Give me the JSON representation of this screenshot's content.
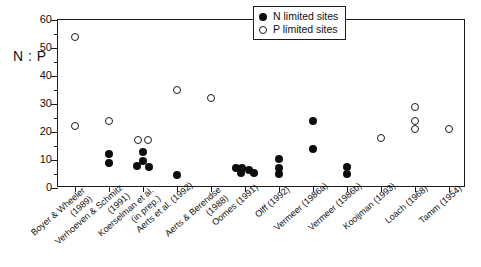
{
  "chart_data": {
    "type": "scatter",
    "title": "",
    "xlabel": "",
    "ylabel": "N : P",
    "ylim": [
      0,
      60
    ],
    "ytick_step": 10,
    "yminor_step": 5,
    "grid": false,
    "legend_position": "top-right",
    "ytick_labels": [
      "0",
      "10",
      "20",
      "30",
      "40",
      "50",
      "60"
    ],
    "categories": [
      "Boyer & Wheeler (1989)",
      "Verhoeven & Schmitz (1991)",
      "Koerselman et al. (in prep.)",
      "Aerts et al. (1992)",
      "Aerts & Berendse (1988)",
      "Oomes (1991)",
      "Olff (1992)",
      "Vermeer (1986a)",
      "Vermeer (1986b)",
      "Kooijman (1993)",
      "Loach (1968)",
      "Tamm (1954)"
    ],
    "category_lines": [
      [
        "Boyer & Wheeler",
        "(1989)"
      ],
      [
        "Verhoeven & Schmitz",
        "(1991)"
      ],
      [
        "Koerselman et al.",
        "(in prep.)"
      ],
      [
        "Aerts et al. (1992)"
      ],
      [
        "Aerts & Berendse",
        "(1988)"
      ],
      [
        "Oomes (1991)"
      ],
      [
        "Olff (1992)"
      ],
      [
        "Vermeer (1986a)"
      ],
      [
        "Vermeer (1986b)"
      ],
      [
        "Kooijman (1993)"
      ],
      [
        "Loach (1968)"
      ],
      [
        "Tamm (1954)"
      ]
    ],
    "series": [
      {
        "name": "N limited sites",
        "marker": "filled-circle",
        "color": "#0d0d0d",
        "points": [
          {
            "category": "Verhoeven & Schmitz (1991)",
            "x": 1,
            "y": 12
          },
          {
            "category": "Verhoeven & Schmitz (1991)",
            "x": 1,
            "y": 9
          },
          {
            "category": "Koerselman et al. (in prep.)",
            "x": 2,
            "y": 13
          },
          {
            "category": "Koerselman et al. (in prep.)",
            "x": 2,
            "y": 9.5
          },
          {
            "category": "Koerselman et al. (in prep.)",
            "x": 2,
            "y": 8
          },
          {
            "category": "Koerselman et al. (in prep.)",
            "x": 2,
            "y": 7.5
          },
          {
            "category": "Aerts et al. (1992)",
            "x": 3,
            "y": 4.5
          },
          {
            "category": "Oomes (1991)",
            "x": 5,
            "y": 7
          },
          {
            "category": "Oomes (1991)",
            "x": 5,
            "y": 7
          },
          {
            "category": "Oomes (1991)",
            "x": 5,
            "y": 6.5
          },
          {
            "category": "Oomes (1991)",
            "x": 5,
            "y": 5.5
          },
          {
            "category": "Oomes (1991)",
            "x": 5,
            "y": 5.5
          },
          {
            "category": "Olff (1992)",
            "x": 6,
            "y": 10.5
          },
          {
            "category": "Olff (1992)",
            "x": 6,
            "y": 7
          },
          {
            "category": "Olff (1992)",
            "x": 6,
            "y": 5
          },
          {
            "category": "Vermeer (1986a)",
            "x": 7,
            "y": 24
          },
          {
            "category": "Vermeer (1986a)",
            "x": 7,
            "y": 14
          },
          {
            "category": "Vermeer (1986b)",
            "x": 8,
            "y": 7.5
          },
          {
            "category": "Vermeer (1986b)",
            "x": 8,
            "y": 5
          }
        ]
      },
      {
        "name": "P limited sites",
        "marker": "open-circle",
        "color": "#ffffff",
        "points": [
          {
            "category": "Boyer & Wheeler (1989)",
            "x": 0,
            "y": 54
          },
          {
            "category": "Boyer & Wheeler (1989)",
            "x": 0,
            "y": 22
          },
          {
            "category": "Verhoeven & Schmitz (1991)",
            "x": 1,
            "y": 24
          },
          {
            "category": "Koerselman et al. (in prep.)",
            "x": 2,
            "y": 17
          },
          {
            "category": "Koerselman et al. (in prep.)",
            "x": 2,
            "y": 17
          },
          {
            "category": "Aerts et al. (1992)",
            "x": 3,
            "y": 35
          },
          {
            "category": "Aerts & Berendse (1988)",
            "x": 4,
            "y": 32
          },
          {
            "category": "Kooijman (1993)",
            "x": 9,
            "y": 18
          },
          {
            "category": "Loach (1968)",
            "x": 10,
            "y": 29
          },
          {
            "category": "Loach (1968)",
            "x": 10,
            "y": 24
          },
          {
            "category": "Loach (1968)",
            "x": 10,
            "y": 21
          },
          {
            "category": "Tamm (1954)",
            "x": 11,
            "y": 21
          }
        ]
      }
    ]
  },
  "legend": {
    "entries": [
      {
        "label": "N limited sites",
        "marker": "filled-circle"
      },
      {
        "label": "P limited sites",
        "marker": "open-circle"
      }
    ]
  }
}
